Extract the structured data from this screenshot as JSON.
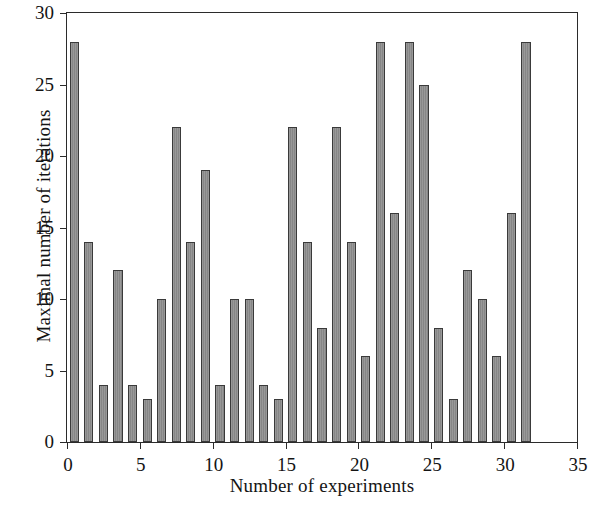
{
  "chart_data": {
    "type": "bar",
    "title": "",
    "xlabel": "Number of experiments",
    "ylabel": "Maximal number of iterations",
    "xlim": [
      0,
      35
    ],
    "ylim": [
      0,
      30
    ],
    "xticks": [
      0,
      5,
      10,
      15,
      20,
      25,
      30,
      35
    ],
    "yticks": [
      0,
      5,
      10,
      15,
      20,
      25,
      30
    ],
    "grid": false,
    "legend": null,
    "bar_color": "#8d8d8d",
    "bar_edge_color": "#3a3a3a",
    "axis_color": "#2b2b2b",
    "categories": [
      1,
      2,
      3,
      4,
      5,
      6,
      7,
      8,
      9,
      10,
      11,
      12,
      13,
      14,
      15,
      16,
      17,
      18,
      19,
      20,
      21,
      22,
      23,
      24,
      25,
      26,
      27,
      28,
      29,
      30,
      31,
      32
    ],
    "values": [
      28,
      14,
      4,
      12,
      4,
      3,
      10,
      22,
      14,
      19,
      4,
      10,
      10,
      4,
      3,
      22,
      14,
      8,
      22,
      14,
      6,
      28,
      16,
      28,
      25,
      8,
      3,
      12,
      10,
      6,
      16,
      28
    ]
  }
}
